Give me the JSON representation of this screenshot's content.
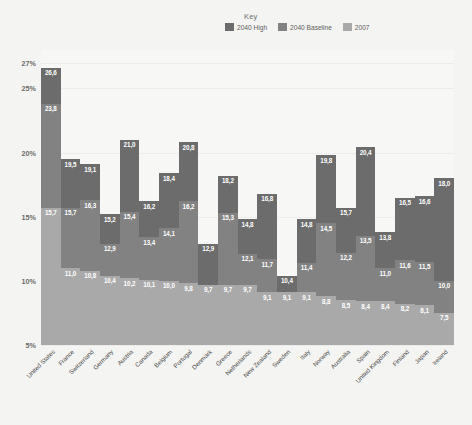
{
  "legend": {
    "title": "Key",
    "items": [
      {
        "label": "2040 High",
        "color": "#6c6c6c"
      },
      {
        "label": "2040 Baseline",
        "color": "#828282"
      },
      {
        "label": "2007",
        "color": "#a9a9a9"
      }
    ]
  },
  "axis": {
    "yticks": [
      "27%",
      "25%",
      "20%",
      "15%",
      "10%",
      "5%"
    ],
    "ytick_values": [
      27,
      25,
      20,
      15,
      10,
      5
    ]
  },
  "chart_data": {
    "type": "bar",
    "title": "",
    "xlabel": "",
    "ylabel": "",
    "ylim": [
      5,
      28
    ],
    "grid": false,
    "legend_position": "top-right",
    "legend_title": "Key",
    "categories": [
      "United States",
      "France",
      "Switzerland",
      "Germany",
      "Austria",
      "Canada",
      "Belgium",
      "Portugal",
      "Denmark",
      "Greece",
      "Netherlands",
      "New Zealand",
      "Sweden",
      "Italy",
      "Norway",
      "Australia",
      "Spain",
      "United Kingdom",
      "Finland",
      "Japan",
      "Ireland"
    ],
    "series": [
      {
        "name": "2040 High",
        "color": "#6c6c6c",
        "values": [
          26.6,
          19.5,
          19.1,
          15.2,
          21.0,
          16.2,
          18.4,
          20.8,
          12.9,
          18.2,
          14.8,
          16.8,
          10.4,
          14.8,
          19.8,
          15.7,
          20.4,
          13.8,
          16.5,
          16.6,
          18.0
        ]
      },
      {
        "name": "2040 Baseline",
        "color": "#828282",
        "values": [
          23.8,
          15.7,
          16.3,
          12.9,
          15.4,
          13.4,
          14.1,
          16.2,
          null,
          15.3,
          12.1,
          11.7,
          null,
          11.4,
          14.5,
          12.2,
          13.5,
          11.0,
          11.6,
          11.5,
          10.0
        ]
      },
      {
        "name": "2007",
        "color": "#a9a9a9",
        "values": [
          15.7,
          11.0,
          10.8,
          10.4,
          10.2,
          10.1,
          10.0,
          9.8,
          9.7,
          9.7,
          9.7,
          9.1,
          9.1,
          9.1,
          8.8,
          8.5,
          8.4,
          8.4,
          8.2,
          8.1,
          7.5
        ]
      }
    ]
  }
}
